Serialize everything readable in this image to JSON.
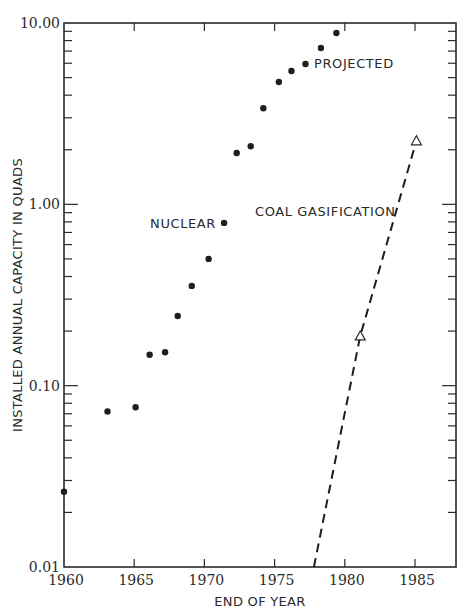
{
  "chart_data": {
    "type": "scatter",
    "title": "",
    "xlabel": "END OF YEAR",
    "ylabel": "INSTALLED ANNUAL CAPACITY IN QUADS",
    "xlim": [
      1960,
      1988
    ],
    "ylim": [
      0.01,
      10.0
    ],
    "yscale": "log",
    "x_ticks": [
      1960,
      1965,
      1970,
      1975,
      1980,
      1985
    ],
    "x_tick_labels": [
      "1960",
      "1965",
      "1970",
      "1975",
      "1980",
      "1985"
    ],
    "y_ticks": [
      0.01,
      0.1,
      1.0,
      10.0
    ],
    "y_tick_labels": [
      "0.01",
      "0.10",
      "1.00",
      "10.00"
    ],
    "grid": false,
    "legend": null,
    "series": [
      {
        "name": "Nuclear",
        "style": "points",
        "marker": "filled-circle",
        "x": [
          1960.0,
          1963.1,
          1965.1,
          1966.1,
          1967.2,
          1968.1,
          1969.1,
          1970.3,
          1971.4,
          1972.3,
          1973.3,
          1974.2,
          1975.3,
          1976.2,
          1977.2,
          1978.3,
          1979.4
        ],
        "values": [
          0.026,
          0.072,
          0.076,
          0.148,
          0.153,
          0.242,
          0.355,
          0.5,
          0.79,
          1.92,
          2.09,
          3.39,
          4.73,
          5.44,
          5.94,
          7.28,
          8.81
        ]
      },
      {
        "name": "Coal Gasification",
        "style": "dashed-line",
        "marker": "open-triangle",
        "x": [
          1977.8,
          1981.1,
          1985.1
        ],
        "values": [
          0.01,
          0.188,
          2.24
        ],
        "marked_points": [
          1,
          2
        ]
      }
    ],
    "annotations": [
      {
        "text": "NUCLEAR",
        "x": 1971.4,
        "y": 0.79,
        "anchor": "left-of-point"
      },
      {
        "text": "PROJECTED",
        "x": 1977.5,
        "y": 6.2,
        "anchor": "right-of-point"
      },
      {
        "text": "COAL GASIFICATION",
        "x": 1973.5,
        "y": 0.85,
        "anchor": "left-of-line"
      }
    ]
  },
  "labels": {
    "xlabel": "END OF YEAR",
    "ylabel": "INSTALLED ANNUAL CAPACITY IN QUADS",
    "nuclear": "NUCLEAR",
    "projected": "PROJECTED",
    "coal": "COAL GASIFICATION"
  }
}
